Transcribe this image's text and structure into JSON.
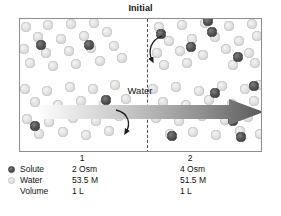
{
  "title": "Initial",
  "diagram": {
    "water_flow_label": "Water",
    "membrane": "dashed-semipermeable-membrane",
    "compartment_labels": [
      "1",
      "2"
    ],
    "flow_direction": "left-to-right",
    "solute_color": "#525252",
    "water_color": "#e2e2e2",
    "arrow_color_start": "#f0f0f0",
    "arrow_color_end": "#5a5a5a"
  },
  "legend": {
    "rows": [
      {
        "icon": "solute-dot-icon",
        "label": "Solute",
        "value1": "2 Osm",
        "value2": "4 Osm"
      },
      {
        "icon": "water-dot-icon",
        "label": "Water",
        "value1": "53.5 M",
        "value2": "51.5 M"
      },
      {
        "icon": "none",
        "label": "Volume",
        "value1": "1 L",
        "value2": "1 L"
      }
    ],
    "column_headers": [
      "1",
      "2"
    ]
  },
  "particles": {
    "left_water": [
      [
        25,
        26
      ],
      [
        47,
        24
      ],
      [
        70,
        23
      ],
      [
        93,
        22
      ],
      [
        37,
        36
      ],
      [
        60,
        38
      ],
      [
        83,
        35
      ],
      [
        106,
        31
      ],
      [
        23,
        48
      ],
      [
        45,
        52
      ],
      [
        68,
        50
      ],
      [
        90,
        47
      ],
      [
        113,
        45
      ],
      [
        29,
        62
      ],
      [
        52,
        65
      ],
      [
        75,
        63
      ],
      [
        99,
        60
      ],
      [
        121,
        57
      ],
      [
        24,
        88
      ],
      [
        46,
        90
      ],
      [
        69,
        86
      ],
      [
        92,
        88
      ],
      [
        114,
        84
      ],
      [
        34,
        101
      ],
      [
        57,
        104
      ],
      [
        80,
        100
      ],
      [
        103,
        103
      ],
      [
        125,
        98
      ],
      [
        26,
        118
      ],
      [
        48,
        121
      ],
      [
        72,
        117
      ],
      [
        95,
        120
      ],
      [
        118,
        115
      ],
      [
        38,
        133
      ],
      [
        62,
        131
      ],
      [
        85,
        134
      ],
      [
        108,
        130
      ]
    ],
    "left_solute": [
      [
        40,
        44
      ],
      [
        88,
        44
      ],
      [
        34,
        125
      ],
      [
        105,
        99
      ]
    ],
    "right_water": [
      [
        158,
        26
      ],
      [
        181,
        24
      ],
      [
        204,
        22
      ],
      [
        228,
        25
      ],
      [
        251,
        23
      ],
      [
        168,
        40
      ],
      [
        191,
        38
      ],
      [
        214,
        36
      ],
      [
        238,
        40
      ],
      [
        256,
        35
      ],
      [
        156,
        52
      ],
      [
        179,
        50
      ],
      [
        202,
        54
      ],
      [
        225,
        48
      ],
      [
        248,
        52
      ],
      [
        163,
        64
      ],
      [
        186,
        62
      ],
      [
        232,
        64
      ],
      [
        254,
        62
      ],
      [
        152,
        88
      ],
      [
        175,
        86
      ],
      [
        198,
        90
      ],
      [
        221,
        85
      ],
      [
        244,
        88
      ],
      [
        258,
        84
      ],
      [
        162,
        101
      ],
      [
        185,
        104
      ],
      [
        208,
        99
      ],
      [
        231,
        103
      ],
      [
        253,
        100
      ],
      [
        155,
        117
      ],
      [
        178,
        120
      ],
      [
        201,
        115
      ],
      [
        224,
        119
      ],
      [
        247,
        116
      ],
      [
        169,
        133
      ],
      [
        192,
        131
      ],
      [
        215,
        134
      ],
      [
        239,
        130
      ],
      [
        259,
        133
      ]
    ],
    "right_solute": [
      [
        160,
        33
      ],
      [
        190,
        46
      ],
      [
        211,
        31
      ],
      [
        237,
        56
      ],
      [
        214,
        92
      ],
      [
        253,
        85
      ],
      [
        232,
        120
      ],
      [
        171,
        135
      ],
      [
        240,
        136
      ],
      [
        207,
        20
      ]
    ]
  }
}
